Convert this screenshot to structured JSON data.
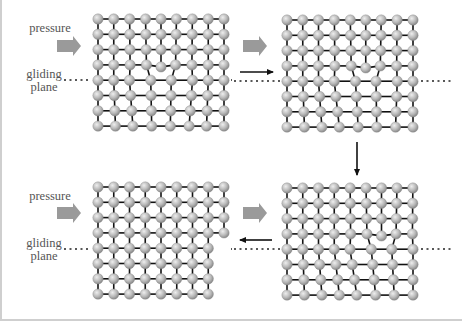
{
  "figure": {
    "labels": {
      "pressure": "pressure",
      "gliding_line1": "gliding",
      "gliding_line2": "plane"
    },
    "colors": {
      "atom_fill": "#b9b9b9",
      "atom_highlight": "#eeeeee",
      "bond": "#111111",
      "pressure_arrow": "#9a9a9a",
      "dotted_line": "#222222",
      "step_arrow": "#111111",
      "border": "#cfcfcf"
    },
    "lattice": {
      "columns": 9,
      "rows": 8,
      "spacing_x": 15.75,
      "spacing_y": 15.3,
      "atom_radius": 5.2,
      "glide_row_index": 4
    },
    "panels": [
      {
        "id": "top-left",
        "state": "dislocation",
        "core_column": 4,
        "origin": [
          96,
          19
        ],
        "show_labels": true,
        "pressure_arrow": [
          55,
          46
        ],
        "dotted": [
          [
            62,
            80
          ],
          [
            229,
            80
          ]
        ]
      },
      {
        "id": "top-right",
        "state": "dislocation",
        "core_column": 5,
        "origin": [
          285,
          20
        ],
        "show_labels": false,
        "pressure_arrow": [
          241,
          46
        ],
        "dotted": [
          [
            232,
            81
          ],
          [
            450,
            81
          ]
        ]
      },
      {
        "id": "bottom-right",
        "state": "dislocation",
        "core_column": 6,
        "origin": [
          285,
          188
        ],
        "show_labels": false,
        "pressure_arrow": [
          241,
          213
        ],
        "dotted": [
          [
            232,
            249
          ],
          [
            450,
            249
          ]
        ]
      },
      {
        "id": "bottom-left",
        "state": "slipped",
        "core_column": 8,
        "origin": [
          96,
          187
        ],
        "show_labels": true,
        "pressure_arrow": [
          55,
          213
        ],
        "dotted": [
          [
            62,
            249
          ],
          [
            229,
            249
          ]
        ]
      }
    ],
    "step_arrows": [
      {
        "id": "arrow-right",
        "direction": "right",
        "from": [
          238,
          72
        ],
        "to": [
          271,
          72
        ]
      },
      {
        "id": "arrow-down",
        "direction": "down",
        "from": [
          355,
          142
        ],
        "to": [
          355,
          175
        ]
      },
      {
        "id": "arrow-left",
        "direction": "left",
        "from": [
          270,
          240
        ],
        "to": [
          238,
          240
        ]
      }
    ]
  }
}
